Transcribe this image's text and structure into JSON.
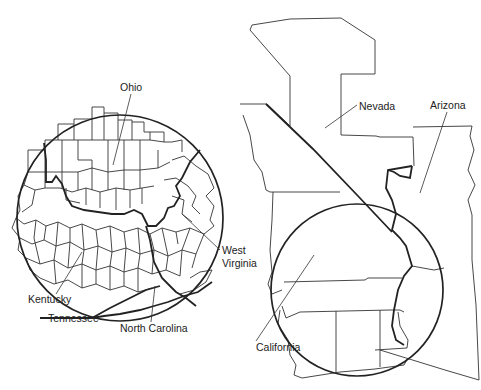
{
  "figure": {
    "left_map": {
      "region": "Ohio River valley tri-state area (county boundaries)",
      "labels": [
        {
          "id": "ohio",
          "text": "Ohio",
          "x": 120,
          "y": 91,
          "leader": [
            [
              131,
              94
            ],
            [
              113,
              165
            ]
          ]
        },
        {
          "id": "west-virginia-1",
          "text": "West",
          "x": 222,
          "y": 254
        },
        {
          "id": "west-virginia-2",
          "text": "Virginia",
          "x": 222,
          "y": 267,
          "leader": [
            [
              220,
              250
            ],
            [
              182,
              214
            ]
          ]
        },
        {
          "id": "kentucky",
          "text": "Kentucky",
          "x": 28,
          "y": 303,
          "leader": [
            [
              56,
              294
            ],
            [
              82,
              252
            ]
          ]
        },
        {
          "id": "tennessee",
          "text": "Tennessee",
          "x": 48,
          "y": 322
        },
        {
          "id": "north-carolina",
          "text": "North Carolina",
          "x": 120,
          "y": 332,
          "leader": [
            [
              151,
              322
            ],
            [
              155,
              286
            ]
          ]
        }
      ],
      "circle": {
        "cx": 120,
        "cy": 218,
        "r": 103
      }
    },
    "right_map": {
      "region": "Nevada / Arizona / California border area (county boundaries)",
      "labels": [
        {
          "id": "nevada",
          "text": "Nevada",
          "x": 359,
          "y": 110,
          "leader": [
            [
              357,
              105
            ],
            [
              325,
              128
            ]
          ]
        },
        {
          "id": "arizona",
          "text": "Arizona",
          "x": 430,
          "y": 109,
          "leader": [
            [
              447,
              112
            ],
            [
              420,
              193
            ]
          ]
        },
        {
          "id": "california",
          "text": "California",
          "x": 256,
          "y": 351,
          "leader": [
            [
              256,
              341
            ],
            [
              314,
              255
            ]
          ]
        }
      ],
      "circle": {
        "cx": 357,
        "cy": 290,
        "r": 86
      }
    }
  }
}
